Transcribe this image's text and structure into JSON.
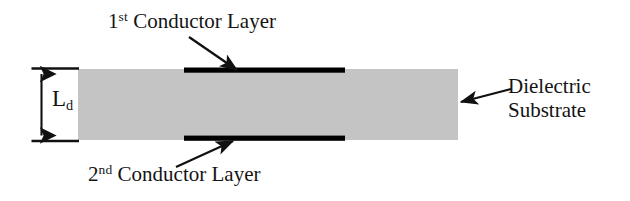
{
  "figure": {
    "type": "cross-section-diagram",
    "background_color": "#ffffff"
  },
  "substrate": {
    "name": "Dielectric Substrate",
    "fill_color": "#c4c4c4",
    "x": 78,
    "y": 69,
    "width": 380,
    "height": 71
  },
  "conductors": [
    {
      "label": "1st Conductor Layer",
      "ordinal_number": "1",
      "ordinal_suffix": "st",
      "position": "top",
      "color": "#000000",
      "x": 184,
      "y": 68,
      "width": 161,
      "height": 5
    },
    {
      "label": "2nd Conductor Layer",
      "ordinal_number": "2",
      "ordinal_suffix": "nd",
      "position": "bottom",
      "color": "#000000",
      "x": 184,
      "y": 136,
      "width": 161,
      "height": 5
    }
  ],
  "dimension": {
    "symbol": "L",
    "subscript": "d",
    "full_label": "Ld",
    "description": "Dielectric substrate thickness",
    "value_top_y": 68,
    "value_bottom_y": 141
  },
  "callouts": [
    {
      "target": "1st Conductor Layer",
      "direction": "down-right"
    },
    {
      "target": "2nd Conductor Layer",
      "direction": "up-right"
    },
    {
      "target": "Dielectric Substrate",
      "direction": "left"
    }
  ],
  "right_label": {
    "line1": "Dielectric",
    "line2": "Substrate"
  },
  "colors": {
    "substrate_gray": "#c4c4c4",
    "conductor_black": "#000000",
    "text_black": "#141414",
    "background_white": "#ffffff"
  }
}
